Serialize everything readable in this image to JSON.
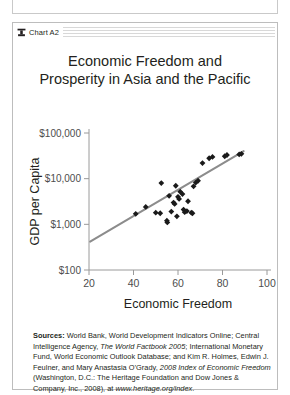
{
  "panel": {
    "header_title": "Chart A2",
    "header_icon": "heritage-foundation-logo-icon"
  },
  "chart_title": {
    "line1": "Economic Freedom and",
    "line2": "Prosperity in Asia and the Pacific"
  },
  "chart_data": {
    "type": "scatter",
    "title": "Economic Freedom and Prosperity in Asia and the Pacific",
    "xlabel": "Economic Freedom",
    "ylabel": "GDP per Capita",
    "xlim": [
      20,
      100
    ],
    "ylim": [
      100,
      100000
    ],
    "yscale": "log",
    "xticks": [
      20,
      40,
      60,
      80,
      100
    ],
    "xtick_labels": [
      "20",
      "40",
      "60",
      "80",
      "100"
    ],
    "yticks": [
      100,
      1000,
      10000,
      100000
    ],
    "ytick_labels": [
      "$100",
      "$1,000",
      "$10,000",
      "$100,000"
    ],
    "grid": false,
    "legend": "none",
    "marker": "diamond",
    "marker_color": "#1a1a1a",
    "points": [
      {
        "x": 41.0,
        "y": 1700
      },
      {
        "x": 45.5,
        "y": 2400
      },
      {
        "x": 50.0,
        "y": 1800
      },
      {
        "x": 52.0,
        "y": 1750
      },
      {
        "x": 52.5,
        "y": 8000
      },
      {
        "x": 55.0,
        "y": 1200
      },
      {
        "x": 55.2,
        "y": 1100
      },
      {
        "x": 56.0,
        "y": 4200
      },
      {
        "x": 57.0,
        "y": 1900
      },
      {
        "x": 58.0,
        "y": 3000
      },
      {
        "x": 58.5,
        "y": 2800
      },
      {
        "x": 59.0,
        "y": 7000
      },
      {
        "x": 59.5,
        "y": 1500
      },
      {
        "x": 60.0,
        "y": 4000
      },
      {
        "x": 60.5,
        "y": 3600
      },
      {
        "x": 61.0,
        "y": 5200
      },
      {
        "x": 62.0,
        "y": 4600
      },
      {
        "x": 62.5,
        "y": 2100
      },
      {
        "x": 63.0,
        "y": 1850
      },
      {
        "x": 64.0,
        "y": 1950
      },
      {
        "x": 64.5,
        "y": 3200
      },
      {
        "x": 66.0,
        "y": 1800
      },
      {
        "x": 66.5,
        "y": 1750
      },
      {
        "x": 67.0,
        "y": 6800
      },
      {
        "x": 68.0,
        "y": 8200
      },
      {
        "x": 69.0,
        "y": 9000
      },
      {
        "x": 71.0,
        "y": 22000
      },
      {
        "x": 74.0,
        "y": 28000
      },
      {
        "x": 75.5,
        "y": 30000
      },
      {
        "x": 81.0,
        "y": 31000
      },
      {
        "x": 82.0,
        "y": 33000
      },
      {
        "x": 87.5,
        "y": 34000
      },
      {
        "x": 88.5,
        "y": 35000
      }
    ],
    "trendline": {
      "type": "linear-on-log-y",
      "color": "#8c8c8c",
      "x_start": 20.5,
      "y_start": 420,
      "x_end": 89.5,
      "y_end": 40000
    }
  },
  "sources": {
    "label": "Sources:",
    "segments": [
      {
        "text": " World Bank, World Development Indicators Online; Central Intelligence Agency, ",
        "style": "normal"
      },
      {
        "text": "The World Factbook 2005",
        "style": "italic"
      },
      {
        "text": "; International Monetary Fund, World Economic Outlook Database; and Kim R. Holmes, Edwin J. Feulner, and Mary Anastasia O’Grady, ",
        "style": "normal"
      },
      {
        "text": "2008 Index of Economic Freedom",
        "style": "italic"
      },
      {
        "text": " (Washington, D.C.: The Heritage Foundation and Dow Jones & Company, Inc., 2008), at ",
        "style": "normal"
      },
      {
        "text": "www.heritage.org/index",
        "style": "italic"
      },
      {
        "text": ".",
        "style": "normal"
      }
    ]
  }
}
